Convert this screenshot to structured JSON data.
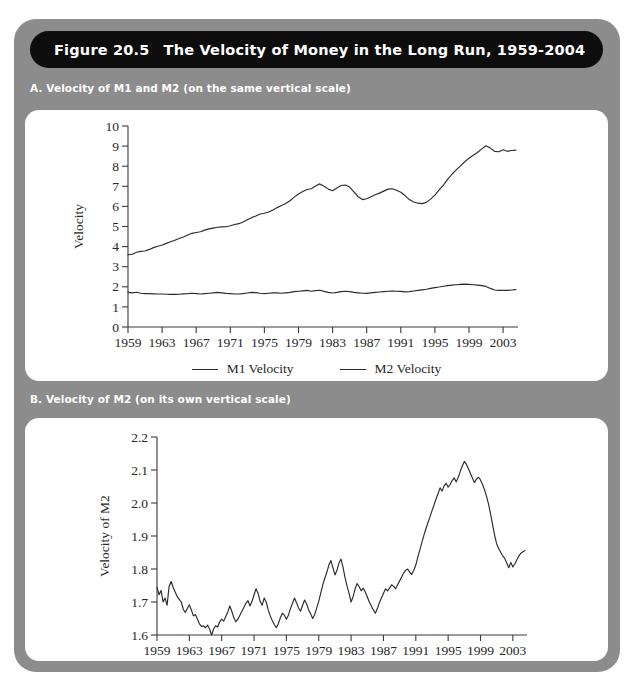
{
  "figure": {
    "number": "Figure 20.5",
    "title": "The Velocity of Money in the Long Run, 1959-2004"
  },
  "panels": {
    "a": {
      "caption": "A. Velocity of M1 and M2 (on the same vertical scale)"
    },
    "b": {
      "caption": "B. Velocity of M2 (on its own vertical scale)"
    }
  },
  "legend": {
    "items": [
      {
        "label": "M1 Velocity",
        "color": "#2b2b2b"
      },
      {
        "label": "M2 Velocity",
        "color": "#2b2b2b"
      }
    ]
  },
  "chart_data": [
    {
      "id": "panel-a",
      "type": "line",
      "title": "A. Velocity of M1 and M2 (on the same vertical scale)",
      "xlabel": "",
      "ylabel": "Velocity",
      "xlim": [
        1959,
        2004.75
      ],
      "ylim": [
        0,
        10
      ],
      "xticks": [
        1959,
        1963,
        1967,
        1971,
        1975,
        1979,
        1983,
        1987,
        1991,
        1995,
        1999,
        2003
      ],
      "yticks": [
        0,
        1,
        2,
        3,
        4,
        5,
        6,
        7,
        8,
        9,
        10
      ],
      "grid": false,
      "legend_position": "below",
      "x": [
        1959,
        1959.5,
        1960,
        1960.5,
        1961,
        1961.5,
        1962,
        1962.5,
        1963,
        1963.5,
        1964,
        1964.5,
        1965,
        1965.5,
        1966,
        1966.5,
        1967,
        1967.5,
        1968,
        1968.5,
        1969,
        1969.5,
        1970,
        1970.5,
        1971,
        1971.5,
        1972,
        1972.5,
        1973,
        1973.5,
        1974,
        1974.5,
        1975,
        1975.5,
        1976,
        1976.5,
        1977,
        1977.5,
        1978,
        1978.5,
        1979,
        1979.5,
        1980,
        1980.5,
        1981,
        1981.5,
        1982,
        1982.5,
        1983,
        1983.5,
        1984,
        1984.5,
        1985,
        1985.5,
        1986,
        1986.5,
        1987,
        1987.5,
        1988,
        1988.5,
        1989,
        1989.5,
        1990,
        1990.5,
        1991,
        1991.5,
        1992,
        1992.5,
        1993,
        1993.5,
        1994,
        1994.5,
        1995,
        1995.5,
        1996,
        1996.5,
        1997,
        1997.5,
        1998,
        1998.5,
        1999,
        1999.5,
        2000,
        2000.5,
        2001,
        2001.5,
        2002,
        2002.5,
        2003,
        2003.5,
        2004,
        2004.5
      ],
      "series": [
        {
          "name": "M1 Velocity",
          "values": [
            3.6,
            3.62,
            3.72,
            3.76,
            3.78,
            3.86,
            3.95,
            4.02,
            4.08,
            4.16,
            4.24,
            4.32,
            4.4,
            4.48,
            4.58,
            4.66,
            4.7,
            4.74,
            4.82,
            4.88,
            4.92,
            4.96,
            4.98,
            4.99,
            5.04,
            5.1,
            5.14,
            5.22,
            5.34,
            5.44,
            5.52,
            5.62,
            5.66,
            5.72,
            5.82,
            5.94,
            6.04,
            6.14,
            6.28,
            6.46,
            6.62,
            6.74,
            6.84,
            6.88,
            7.02,
            7.12,
            7.0,
            6.86,
            6.78,
            6.92,
            7.04,
            7.06,
            6.96,
            6.72,
            6.48,
            6.34,
            6.38,
            6.48,
            6.58,
            6.66,
            6.76,
            6.86,
            6.88,
            6.8,
            6.7,
            6.54,
            6.34,
            6.22,
            6.16,
            6.14,
            6.2,
            6.36,
            6.56,
            6.82,
            7.06,
            7.34,
            7.6,
            7.82,
            8.02,
            8.22,
            8.4,
            8.54,
            8.68,
            8.86,
            9.02,
            8.9,
            8.74,
            8.72,
            8.82,
            8.74,
            8.78,
            8.8
          ]
        },
        {
          "name": "M2 Velocity",
          "values": [
            1.72,
            1.7,
            1.73,
            1.68,
            1.66,
            1.66,
            1.65,
            1.64,
            1.64,
            1.63,
            1.62,
            1.62,
            1.63,
            1.65,
            1.66,
            1.68,
            1.66,
            1.64,
            1.66,
            1.68,
            1.7,
            1.72,
            1.7,
            1.67,
            1.66,
            1.64,
            1.64,
            1.66,
            1.69,
            1.72,
            1.71,
            1.68,
            1.66,
            1.68,
            1.7,
            1.7,
            1.68,
            1.7,
            1.72,
            1.76,
            1.78,
            1.8,
            1.82,
            1.78,
            1.81,
            1.83,
            1.77,
            1.72,
            1.69,
            1.72,
            1.76,
            1.78,
            1.76,
            1.72,
            1.7,
            1.68,
            1.67,
            1.7,
            1.72,
            1.74,
            1.76,
            1.78,
            1.79,
            1.78,
            1.77,
            1.75,
            1.76,
            1.79,
            1.82,
            1.85,
            1.88,
            1.92,
            1.96,
            1.99,
            2.03,
            2.06,
            2.08,
            2.1,
            2.12,
            2.13,
            2.12,
            2.1,
            2.08,
            2.06,
            2.02,
            1.92,
            1.84,
            1.82,
            1.83,
            1.82,
            1.84,
            1.86
          ]
        }
      ]
    },
    {
      "id": "panel-b",
      "type": "line",
      "title": "B. Velocity of M2 (on its own vertical scale)",
      "xlabel": "",
      "ylabel": "Velocity of M2",
      "xlim": [
        1959,
        2004.75
      ],
      "ylim": [
        1.6,
        2.2
      ],
      "xticks": [
        1959,
        1963,
        1967,
        1971,
        1975,
        1979,
        1983,
        1987,
        1991,
        1995,
        1999,
        2003
      ],
      "yticks": [
        1.6,
        1.7,
        1.8,
        1.9,
        2.0,
        2.1,
        2.2
      ],
      "ytick_labels": [
        "1.6",
        "1.7",
        "1.8",
        "1.9",
        "2.0",
        "2.1",
        "2.2"
      ],
      "grid": false,
      "legend_position": "none",
      "x": [
        1959,
        1959.25,
        1959.5,
        1959.75,
        1960,
        1960.25,
        1960.5,
        1960.75,
        1961,
        1961.25,
        1961.5,
        1961.75,
        1962,
        1962.25,
        1962.5,
        1962.75,
        1963,
        1963.25,
        1963.5,
        1963.75,
        1964,
        1964.25,
        1964.5,
        1964.75,
        1965,
        1965.25,
        1965.5,
        1965.75,
        1966,
        1966.25,
        1966.5,
        1966.75,
        1967,
        1967.25,
        1967.5,
        1967.75,
        1968,
        1968.25,
        1968.5,
        1968.75,
        1969,
        1969.25,
        1969.5,
        1969.75,
        1970,
        1970.25,
        1970.5,
        1970.75,
        1971,
        1971.25,
        1971.5,
        1971.75,
        1972,
        1972.25,
        1972.5,
        1972.75,
        1973,
        1973.25,
        1973.5,
        1973.75,
        1974,
        1974.25,
        1974.5,
        1974.75,
        1975,
        1975.25,
        1975.5,
        1975.75,
        1976,
        1976.25,
        1976.5,
        1976.75,
        1977,
        1977.25,
        1977.5,
        1977.75,
        1978,
        1978.25,
        1978.5,
        1978.75,
        1979,
        1979.25,
        1979.5,
        1979.75,
        1980,
        1980.25,
        1980.5,
        1980.75,
        1981,
        1981.25,
        1981.5,
        1981.75,
        1982,
        1982.25,
        1982.5,
        1982.75,
        1983,
        1983.25,
        1983.5,
        1983.75,
        1984,
        1984.25,
        1984.5,
        1984.75,
        1985,
        1985.25,
        1985.5,
        1985.75,
        1986,
        1986.25,
        1986.5,
        1986.75,
        1987,
        1987.25,
        1987.5,
        1987.75,
        1988,
        1988.25,
        1988.5,
        1988.75,
        1989,
        1989.25,
        1989.5,
        1989.75,
        1990,
        1990.25,
        1990.5,
        1990.75,
        1991,
        1991.25,
        1991.5,
        1991.75,
        1992,
        1992.25,
        1992.5,
        1992.75,
        1993,
        1993.25,
        1993.5,
        1993.75,
        1994,
        1994.25,
        1994.5,
        1994.75,
        1995,
        1995.25,
        1995.5,
        1995.75,
        1996,
        1996.25,
        1996.5,
        1996.75,
        1997,
        1997.25,
        1997.5,
        1997.75,
        1998,
        1998.25,
        1998.5,
        1998.75,
        1999,
        1999.25,
        1999.5,
        1999.75,
        2000,
        2000.25,
        2000.5,
        2000.75,
        2001,
        2001.25,
        2001.5,
        2001.75,
        2002,
        2002.25,
        2002.5,
        2002.75,
        2003,
        2003.25,
        2003.5,
        2003.75,
        2004,
        2004.25,
        2004.5
      ],
      "values": [
        1.745,
        1.722,
        1.735,
        1.7,
        1.712,
        1.69,
        1.748,
        1.762,
        1.744,
        1.73,
        1.716,
        1.708,
        1.7,
        1.678,
        1.668,
        1.68,
        1.692,
        1.676,
        1.658,
        1.662,
        1.648,
        1.634,
        1.626,
        1.628,
        1.622,
        1.63,
        1.618,
        1.6,
        1.618,
        1.628,
        1.624,
        1.64,
        1.648,
        1.642,
        1.656,
        1.67,
        1.688,
        1.672,
        1.652,
        1.64,
        1.648,
        1.66,
        1.672,
        1.684,
        1.696,
        1.704,
        1.688,
        1.702,
        1.722,
        1.74,
        1.726,
        1.702,
        1.69,
        1.712,
        1.7,
        1.676,
        1.658,
        1.644,
        1.632,
        1.622,
        1.634,
        1.652,
        1.666,
        1.66,
        1.648,
        1.66,
        1.68,
        1.696,
        1.712,
        1.698,
        1.682,
        1.672,
        1.69,
        1.706,
        1.694,
        1.676,
        1.664,
        1.65,
        1.662,
        1.682,
        1.702,
        1.728,
        1.752,
        1.772,
        1.79,
        1.812,
        1.826,
        1.804,
        1.782,
        1.796,
        1.818,
        1.83,
        1.806,
        1.774,
        1.748,
        1.726,
        1.7,
        1.716,
        1.74,
        1.756,
        1.746,
        1.734,
        1.742,
        1.73,
        1.716,
        1.7,
        1.688,
        1.676,
        1.666,
        1.68,
        1.698,
        1.712,
        1.726,
        1.74,
        1.734,
        1.742,
        1.752,
        1.748,
        1.74,
        1.752,
        1.764,
        1.776,
        1.788,
        1.796,
        1.8,
        1.79,
        1.784,
        1.796,
        1.812,
        1.836,
        1.858,
        1.88,
        1.902,
        1.922,
        1.94,
        1.958,
        1.976,
        1.994,
        2.012,
        2.028,
        2.046,
        2.036,
        2.052,
        2.06,
        2.048,
        2.056,
        2.068,
        2.076,
        2.064,
        2.078,
        2.096,
        2.112,
        2.126,
        2.118,
        2.104,
        2.09,
        2.076,
        2.062,
        2.072,
        2.078,
        2.07,
        2.056,
        2.04,
        2.02,
        1.996,
        1.966,
        1.934,
        1.902,
        1.876,
        1.862,
        1.85,
        1.84,
        1.832,
        1.818,
        1.804,
        1.82,
        1.806,
        1.816,
        1.828,
        1.84,
        1.848,
        1.852,
        1.856
      ]
    }
  ]
}
